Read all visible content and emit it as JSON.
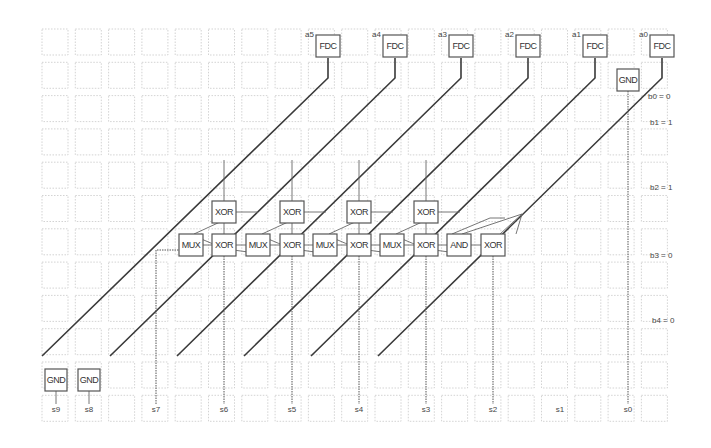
{
  "diagram": {
    "grid": {
      "cols": 19,
      "rows": 12,
      "origin_x": 42,
      "origin_y": 29,
      "pitch": 33.3,
      "cell_size": 26
    },
    "inputs": [
      {
        "id": "a5",
        "label": "a5",
        "block": "FDC",
        "cx": 328,
        "cy": 46
      },
      {
        "id": "a4",
        "label": "a4",
        "block": "FDC",
        "cx": 395,
        "cy": 46
      },
      {
        "id": "a3",
        "label": "a3",
        "block": "FDC",
        "cx": 461,
        "cy": 46
      },
      {
        "id": "a2",
        "label": "a2",
        "block": "FDC",
        "cx": 528,
        "cy": 46
      },
      {
        "id": "a1",
        "label": "a1",
        "block": "FDC",
        "cx": 595,
        "cy": 46
      },
      {
        "id": "a0",
        "label": "a0",
        "block": "FDC",
        "cx": 662,
        "cy": 46
      }
    ],
    "gnd_blocks": [
      {
        "id": "gnd-top",
        "label": "GND",
        "cx": 628,
        "cy": 80
      },
      {
        "id": "gnd-s9",
        "label": "GND",
        "cx": 56,
        "cy": 380
      },
      {
        "id": "gnd-s8",
        "label": "GND",
        "cx": 89,
        "cy": 380
      }
    ],
    "gates_top_row": [
      {
        "label": "XOR",
        "cx": 224,
        "cy": 212
      },
      {
        "label": "XOR",
        "cx": 292,
        "cy": 212
      },
      {
        "label": "XOR",
        "cx": 359,
        "cy": 212
      },
      {
        "label": "XOR",
        "cx": 426,
        "cy": 212
      }
    ],
    "gates_mid_row": [
      {
        "label": "MUX",
        "cx": 191,
        "cy": 245
      },
      {
        "label": "XOR",
        "cx": 224,
        "cy": 245
      },
      {
        "label": "MUX",
        "cx": 258,
        "cy": 245
      },
      {
        "label": "XOR",
        "cx": 292,
        "cy": 245
      },
      {
        "label": "MUX",
        "cx": 325,
        "cy": 245
      },
      {
        "label": "XOR",
        "cx": 359,
        "cy": 245
      },
      {
        "label": "MUX",
        "cx": 392,
        "cy": 245
      },
      {
        "label": "XOR",
        "cx": 426,
        "cy": 245
      },
      {
        "label": "AND",
        "cx": 459,
        "cy": 245
      },
      {
        "label": "XOR",
        "cx": 493,
        "cy": 245
      }
    ],
    "b_labels": [
      {
        "text": "b0 = 0",
        "x": 648,
        "y": 99
      },
      {
        "text": "b1 = 1",
        "x": 650,
        "y": 125
      },
      {
        "text": "b2 = 1",
        "x": 650,
        "y": 190
      },
      {
        "text": "b3 = 0",
        "x": 650,
        "y": 258
      },
      {
        "text": "b4 = 0",
        "x": 652,
        "y": 323
      }
    ],
    "outputs": [
      {
        "text": "s9",
        "x": 56,
        "y": 412
      },
      {
        "text": "s8",
        "x": 89,
        "y": 412
      },
      {
        "text": "s7",
        "x": 156,
        "y": 412
      },
      {
        "text": "s6",
        "x": 224,
        "y": 412
      },
      {
        "text": "s5",
        "x": 292,
        "y": 412
      },
      {
        "text": "s4",
        "x": 359,
        "y": 412
      },
      {
        "text": "s3",
        "x": 426,
        "y": 412
      },
      {
        "text": "s2",
        "x": 493,
        "y": 412
      },
      {
        "text": "s1",
        "x": 560,
        "y": 412
      },
      {
        "text": "s0",
        "x": 628,
        "y": 412
      }
    ]
  }
}
